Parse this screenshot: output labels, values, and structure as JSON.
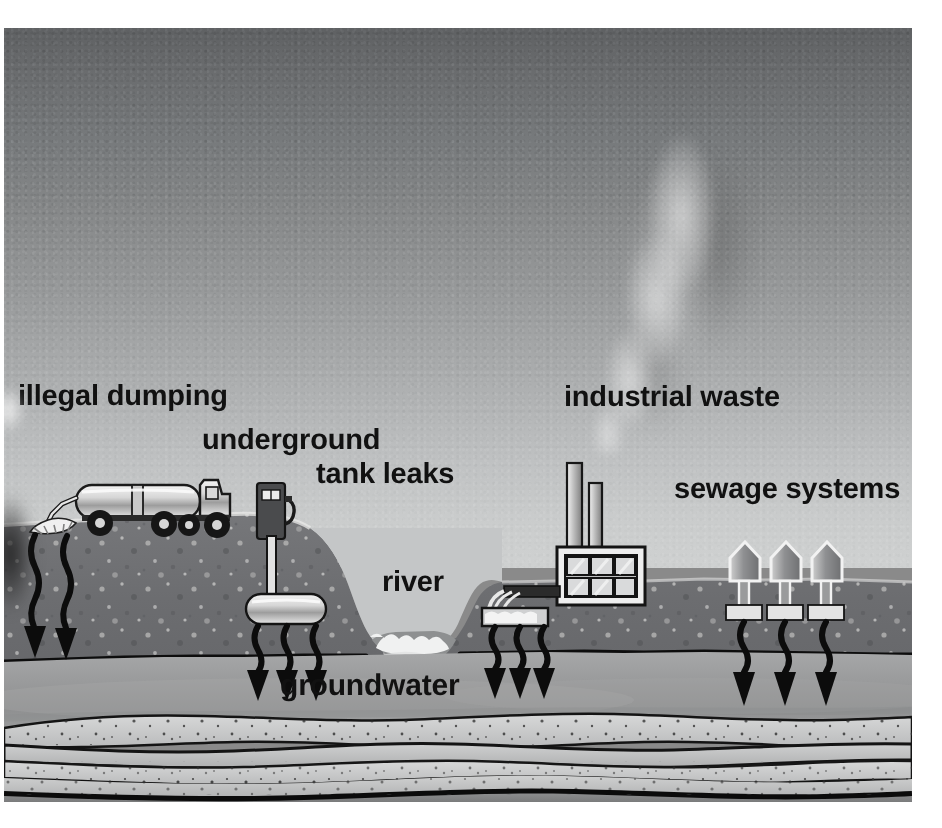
{
  "diagram": {
    "type": "cross-section illustration",
    "labels": {
      "illegal_dumping": "illegal dumping",
      "underground": "underground",
      "tank_leaks": "tank leaks",
      "river": "river",
      "groundwater": "groundwater",
      "industrial_waste": "industrial waste",
      "sewage_systems": "sewage systems"
    },
    "elements": {
      "tanker_truck": "tanker-truck",
      "dump_spill": "liquid-spill",
      "gas_pump": "fuel-dispenser",
      "buried_tank": "underground-storage-tank",
      "factory": "factory-building",
      "smokestacks": 2,
      "factory_windows": 6,
      "discharge_pipe": "outfall-pipe",
      "houses": 3,
      "septic_tanks": 3,
      "smoke_plume": "smoke-plume",
      "water_table_line": "water-table",
      "bedrock_strata": "bedrock-layers"
    },
    "arrow_groups": {
      "dumping_arrows": 2,
      "tank_leak_arrows": 3,
      "outfall_arrows": 3,
      "sewage_arrows": 3
    },
    "colors": {
      "sky_top": "#5f6163",
      "sky_horizon": "#cfd1d1",
      "soil": "#6f7072",
      "groundwater": "#9a9b9c",
      "bedrock_light": "#c6c7c7",
      "bedrock_dark": "#808182",
      "ink": "#111111",
      "highlight": "#f2f2f2"
    }
  }
}
